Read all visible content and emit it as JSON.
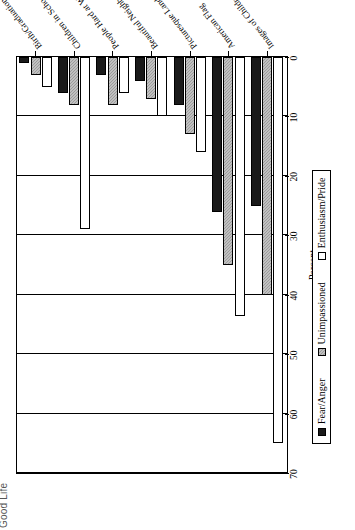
{
  "chart_data": {
    "type": "bar",
    "orientation": "horizontal",
    "title": "Good Life",
    "xlabel": "Percent",
    "ylabel": "",
    "xlim": [
      0,
      70
    ],
    "xticks": [
      0,
      10,
      20,
      30,
      40,
      50,
      60,
      70
    ],
    "grid": true,
    "legend_position": "bottom",
    "categories": [
      "Images of Children",
      "American Flag",
      "Picturesque Landscapes",
      "Beautiful Neighborhoods",
      "People Hard at Work",
      "Children in School",
      "Birth/Graduation/Wedding"
    ],
    "series": [
      {
        "name": "Fear/Anger",
        "color": "#1a1a1a",
        "values": [
          25,
          26,
          8,
          4,
          3,
          6,
          1
        ]
      },
      {
        "name": "Unimpassioned",
        "color": "#9b9b9b",
        "values": [
          40,
          35,
          13,
          7,
          8,
          8,
          3
        ]
      },
      {
        "name": "Enthusiasm/Pride",
        "color": "#ffffff",
        "values": [
          65,
          43.5,
          16,
          10,
          6,
          29,
          5
        ]
      }
    ]
  },
  "legend": {
    "items": [
      {
        "label": "Fear/Anger"
      },
      {
        "label": "Unimpassioned"
      },
      {
        "label": "Enthusiasm/Pride"
      }
    ]
  },
  "axis": {
    "tick_labels": [
      "0",
      "10",
      "20",
      "30",
      "40",
      "50",
      "60",
      "70"
    ],
    "title": "Percent"
  },
  "title_text": "Good Life"
}
